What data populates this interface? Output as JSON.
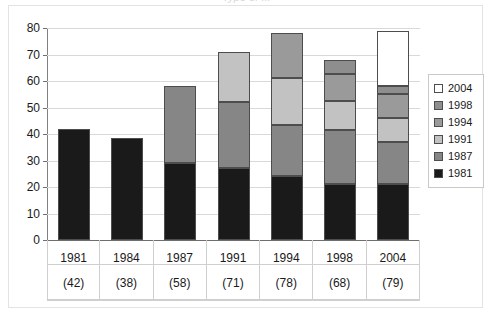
{
  "title_remnant": "Type of ...",
  "chart_data": {
    "type": "bar",
    "stacked": true,
    "title": "",
    "subtitle": "",
    "xlabel": "",
    "ylabel": "",
    "ylim": [
      0,
      80
    ],
    "ytick_step": 10,
    "yticks": [
      80,
      70,
      60,
      50,
      40,
      30,
      20,
      10,
      0
    ],
    "grid": true,
    "legend_position": "right",
    "categories": [
      "1981",
      "1984",
      "1987",
      "1991",
      "1994",
      "1998",
      "2004"
    ],
    "category_sublabels": [
      "(42)",
      "(38)",
      "(58)",
      "(71)",
      "(78)",
      "(68)",
      "(79)"
    ],
    "category_totals": [
      42,
      38,
      58,
      71,
      78,
      68,
      79
    ],
    "series": [
      {
        "name": "1981",
        "color": "#1a1a1a",
        "values": [
          42,
          38.5,
          29,
          27,
          24,
          21,
          21
        ]
      },
      {
        "name": "1987",
        "color": "#868686",
        "values": [
          0,
          0,
          29,
          25,
          19.5,
          20.5,
          16
        ]
      },
      {
        "name": "1991",
        "color": "#c2c2c2",
        "values": [
          0,
          0,
          0,
          19,
          17.5,
          11,
          9
        ]
      },
      {
        "name": "1994",
        "color": "#9a9a9a",
        "values": [
          0,
          0,
          0,
          0,
          17,
          10,
          9
        ]
      },
      {
        "name": "1998",
        "color": "#8e8e8e",
        "values": [
          0,
          0,
          0,
          0,
          0,
          5.5,
          3
        ]
      },
      {
        "name": "2004",
        "color": "#ffffff",
        "values": [
          0,
          0,
          0,
          0,
          0,
          0,
          21
        ]
      }
    ],
    "legend_entries": [
      {
        "label": "2004",
        "color": "#ffffff"
      },
      {
        "label": "1998",
        "color": "#8e8e8e"
      },
      {
        "label": "1994",
        "color": "#9a9a9a"
      },
      {
        "label": "1991",
        "color": "#c2c2c2"
      },
      {
        "label": "1987",
        "color": "#868686"
      },
      {
        "label": "1981",
        "color": "#1a1a1a"
      }
    ]
  }
}
